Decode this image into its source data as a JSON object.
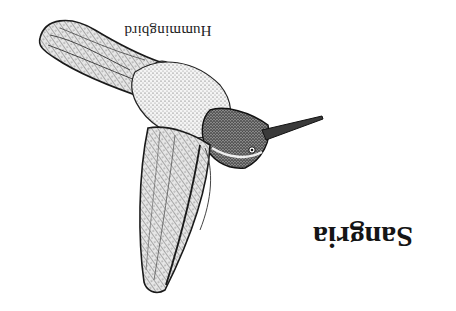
{
  "image": {
    "orientation": "upside-down",
    "subject": "hummingbird illustration",
    "style": "stippled pen-and-ink",
    "background_color": "#ffffff",
    "ink_color": "#1a1a1a"
  },
  "captions": {
    "label": "Hummingbird",
    "title": "Sangria"
  }
}
